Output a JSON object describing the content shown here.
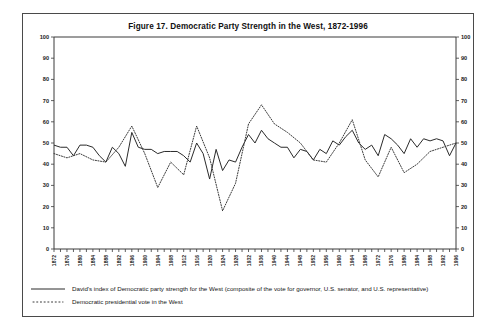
{
  "figure": {
    "title": "Figure 17.  Democratic Party Strength in the West, 1872-1996"
  },
  "legend": {
    "items": [
      {
        "style": "solid",
        "label": "David's index of Democratic party strength for the West (composite of the vote for governor, U.S. senator, and U.S. representative)"
      },
      {
        "style": "dotted",
        "label": "Democratic presidential vote in the West"
      }
    ]
  },
  "chart_data": {
    "type": "line",
    "title": "Figure 17.  Democratic Party Strength in the West, 1872-1996",
    "xlabel": "",
    "ylabel": "",
    "xlim": [
      1872,
      1996
    ],
    "ylim": [
      0,
      100
    ],
    "grid": false,
    "legend_position": "below-plot",
    "y_ticks": [
      0,
      10,
      20,
      30,
      40,
      50,
      60,
      70,
      80,
      90,
      100
    ],
    "y_axis_both_sides": true,
    "x_tick_labels": [
      "1872",
      "1876",
      "1880",
      "1884",
      "1888",
      "1892",
      "1896",
      "1900",
      "1904",
      "1908",
      "1912",
      "1916",
      "1920",
      "1924",
      "1928",
      "1932",
      "1936",
      "1940",
      "1944",
      "1948",
      "1952",
      "1956",
      "1960",
      "1964",
      "1968",
      "1972",
      "1976",
      "1980",
      "1984",
      "1988",
      "1992",
      "1996"
    ],
    "x_tick_interval_years": 4,
    "x_minor_tick_interval_years": 2,
    "series": [
      {
        "name": "David's index of Democratic party strength for the West (composite of the vote for governor, U.S. senator, and U.S. representative)",
        "style": "solid",
        "x": [
          1872,
          1874,
          1876,
          1878,
          1880,
          1882,
          1884,
          1886,
          1888,
          1890,
          1892,
          1894,
          1896,
          1898,
          1900,
          1902,
          1904,
          1906,
          1908,
          1910,
          1912,
          1914,
          1916,
          1918,
          1920,
          1922,
          1924,
          1926,
          1928,
          1930,
          1932,
          1934,
          1936,
          1938,
          1940,
          1942,
          1944,
          1946,
          1948,
          1950,
          1952,
          1954,
          1956,
          1958,
          1960,
          1962,
          1964,
          1966,
          1968,
          1970,
          1972,
          1974,
          1976,
          1978,
          1980,
          1982,
          1984,
          1986,
          1988,
          1990,
          1992,
          1994,
          1996
        ],
        "y": [
          49,
          48,
          48,
          44,
          49,
          49,
          48,
          44,
          41,
          48,
          45,
          39,
          55,
          48,
          47,
          47,
          45,
          46,
          46,
          46,
          44,
          41,
          50,
          45,
          33,
          47,
          37,
          42,
          41,
          48,
          54,
          50,
          56,
          52,
          50,
          48,
          48,
          43,
          47,
          46,
          42,
          47,
          45,
          51,
          49,
          53,
          56,
          50,
          47,
          49,
          44,
          54,
          52,
          49,
          45,
          52,
          48,
          52,
          51,
          52,
          51,
          44,
          50
        ]
      },
      {
        "name": "Democratic presidential vote in the West",
        "style": "dotted",
        "x": [
          1872,
          1876,
          1880,
          1884,
          1888,
          1892,
          1896,
          1900,
          1904,
          1908,
          1912,
          1916,
          1920,
          1924,
          1928,
          1932,
          1936,
          1940,
          1944,
          1948,
          1952,
          1956,
          1960,
          1964,
          1968,
          1972,
          1976,
          1980,
          1984,
          1988,
          1992,
          1996
        ],
        "y": [
          45,
          43,
          45,
          42,
          41,
          48,
          58,
          45,
          29,
          41,
          35,
          58,
          43,
          18,
          31,
          59,
          68,
          59,
          55,
          50,
          42,
          41,
          50,
          61,
          42,
          34,
          48,
          36,
          40,
          46,
          48,
          50
        ]
      }
    ]
  }
}
